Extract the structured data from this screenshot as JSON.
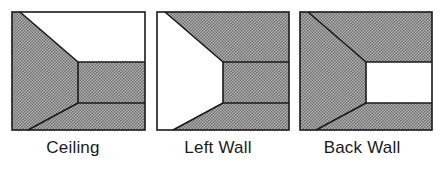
{
  "figure": {
    "panels": [
      {
        "label": "Ceiling",
        "highlighted_surface": "ceiling"
      },
      {
        "label": "Left Wall",
        "highlighted_surface": "left-wall"
      },
      {
        "label": "Back Wall",
        "highlighted_surface": "back-wall"
      }
    ],
    "colors": {
      "shaded": "#9a9a9a",
      "highlight": "#ffffff",
      "line": "#1a1a1a"
    }
  }
}
